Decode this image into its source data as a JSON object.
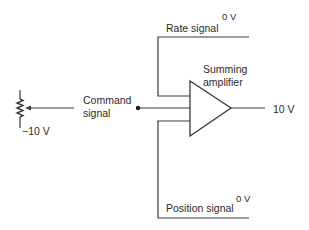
{
  "diagram": {
    "colors": {
      "line": "#3a3a3a",
      "text": "#2a2a2a",
      "background": "#ffffff"
    },
    "labels": {
      "rate_signal": "Rate signal",
      "rate_voltage": "0 V",
      "summing_amplifier_line1": "Summing",
      "summing_amplifier_line2": "amplifier",
      "command_signal_line1": "Command",
      "command_signal_line2": "signal",
      "output_voltage": "10 V",
      "pot_voltage": "−10 V",
      "position_signal": "Position signal",
      "position_voltage": "0 V"
    },
    "components": [
      {
        "id": "potentiometer",
        "type": "variable-resistor",
        "voltage": "−10 V"
      },
      {
        "id": "command-signal",
        "type": "input",
        "label": "Command signal"
      },
      {
        "id": "rate-signal",
        "type": "input",
        "label": "Rate signal",
        "voltage": "0 V"
      },
      {
        "id": "position-signal",
        "type": "input",
        "label": "Position signal",
        "voltage": "0 V"
      },
      {
        "id": "summing-amplifier",
        "type": "amplifier",
        "label": "Summing amplifier",
        "output": "10 V"
      }
    ]
  }
}
